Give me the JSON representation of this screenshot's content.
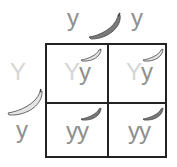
{
  "top_alleles": [
    "y",
    "y"
  ],
  "left_alleles": [
    "Y",
    "y"
  ],
  "top_icon": "dark-banana-icon",
  "left_icon": "light-banana-icon",
  "cells": [
    {
      "row": 0,
      "col": 0,
      "genotype": [
        "Y",
        "y"
      ],
      "icon": "light-banana-icon"
    },
    {
      "row": 0,
      "col": 1,
      "genotype": [
        "Y",
        "y"
      ],
      "icon": "light-banana-icon"
    },
    {
      "row": 1,
      "col": 0,
      "genotype": [
        "y",
        "y"
      ],
      "icon": "dark-banana-icon"
    },
    {
      "row": 1,
      "col": 1,
      "genotype": [
        "y",
        "y"
      ],
      "icon": "dark-banana-icon"
    }
  ],
  "colors": {
    "dominant_text": "#d6d6d6",
    "recessive_text": "#8f8f8f",
    "dark_banana": "#7a7a7a",
    "light_banana": "#e4e4e4",
    "grid": "#222222"
  }
}
